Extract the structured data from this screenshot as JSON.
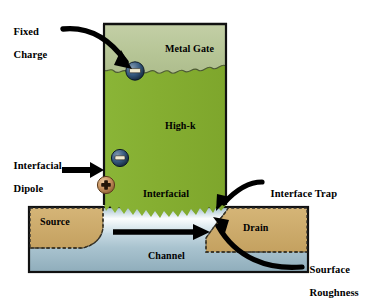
{
  "figure": {
    "type": "cross-section-schematic",
    "background_color": "#ffffff"
  },
  "colors": {
    "metal_gate": "#b9c79a",
    "high_k": "#86b033",
    "interfacial": "#86b033",
    "source_drain": "#cdab6a",
    "channel_light": "#f2f7f9",
    "channel_mid": "#a8c2ce",
    "channel_dark": "#7d9aa8",
    "outline": "#1a1a1a",
    "negative_charge": "#2b4a6b",
    "positive_charge": "#c08a5a",
    "arrow": "#000000",
    "text": "#000000"
  },
  "regions": [
    {
      "id": "metal-gate",
      "label": "Metal Gate",
      "x": 165,
      "y": 43,
      "color": "#b9c79a"
    },
    {
      "id": "high-k",
      "label": "High-k",
      "x": 165,
      "y": 120,
      "color": "#86b033"
    },
    {
      "id": "interfacial",
      "label": "Interfacial",
      "x": 178,
      "y": 194,
      "color": "#86b033"
    },
    {
      "id": "source",
      "label": "Source",
      "x": 56,
      "y": 224,
      "color": "#cdab6a"
    },
    {
      "id": "drain",
      "label": "Drain",
      "x": 259,
      "y": 228,
      "color": "#cdab6a"
    },
    {
      "id": "channel",
      "label": "Channel",
      "x": 168,
      "y": 256,
      "color": "#a8c2ce"
    }
  ],
  "callouts": [
    {
      "id": "fixed-charge",
      "line1": "Fixed",
      "line2": "Charge",
      "x": 8,
      "y": 14,
      "align": "left"
    },
    {
      "id": "interfacial-dipole",
      "line1": "Interfacial",
      "line2": "Dipole",
      "x": 8,
      "y": 148,
      "align": "left"
    },
    {
      "id": "interface-trap",
      "line1": "Interface Trap",
      "line2": "",
      "x": 265,
      "y": 176,
      "align": "left"
    },
    {
      "id": "sourface-roughness",
      "line1": "Sourface",
      "line2": "Roughness",
      "x": 304,
      "y": 252,
      "align": "left"
    }
  ],
  "charges": [
    {
      "id": "fixed-charge-particle",
      "sign": "minus",
      "cx": 135,
      "cy": 71,
      "r": 9,
      "color": "#2b4a6b"
    },
    {
      "id": "dipole-negative-particle",
      "sign": "minus",
      "cx": 120,
      "cy": 158,
      "r": 8.5,
      "color": "#2b4a6b"
    },
    {
      "id": "dipole-positive-particle",
      "sign": "plus",
      "cx": 106,
      "cy": 185,
      "r": 8.5,
      "color": "#c08a5a"
    }
  ],
  "arrows": [
    {
      "id": "fixed-charge-arrow",
      "from": "Fixed Charge label",
      "to": "negative charge at metal/high-k interface"
    },
    {
      "id": "interfacial-dipole-arrow",
      "from": "Interfacial Dipole label",
      "to": "dipole charge pair"
    },
    {
      "id": "interface-trap-arrow",
      "from": "Interface Trap label",
      "to": "interfacial layer / channel boundary"
    },
    {
      "id": "sourface-roughness-arrow",
      "from": "Sourface Roughness label",
      "to": "rough channel surface"
    },
    {
      "id": "channel-current-arrow",
      "from": "source side of channel",
      "to": "drain side of channel"
    }
  ]
}
